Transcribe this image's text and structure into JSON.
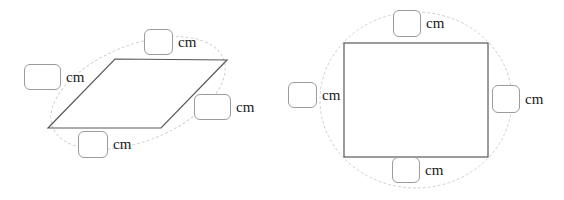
{
  "canvas": {
    "width": 564,
    "height": 200,
    "background": "#ffffff"
  },
  "style": {
    "shape_stroke": "#595959",
    "guide_stroke": "#cfcfcf",
    "box_border": "#9b9b9b",
    "text_color": "#1a1a1a"
  },
  "figures": [
    {
      "id": "parallelogram",
      "name": "parallelogram",
      "shape": {
        "type": "parallelogram",
        "points": "115,59 227,60 161,128 48,128"
      },
      "guide": {
        "type": "ellipse",
        "cx": 138,
        "cy": 93,
        "rx": 92,
        "ry": 48,
        "rotation": -22
      },
      "fields": [
        {
          "id": "pg-left",
          "side": "left",
          "value": "",
          "placeholder": "",
          "unit": "cm"
        },
        {
          "id": "pg-top",
          "side": "top",
          "value": "",
          "placeholder": "",
          "unit": "cm"
        },
        {
          "id": "pg-right",
          "side": "right",
          "value": "",
          "placeholder": "",
          "unit": "cm"
        },
        {
          "id": "pg-bottom",
          "side": "bottom",
          "value": "",
          "placeholder": "",
          "unit": "cm"
        }
      ]
    },
    {
      "id": "rectangle",
      "name": "rectangle",
      "shape": {
        "type": "rectangle",
        "x": 62,
        "y": 43,
        "width": 144,
        "height": 114
      },
      "guide": {
        "type": "ellipse",
        "cx": 134,
        "cy": 100,
        "rx": 96,
        "ry": 88,
        "rotation": 0
      },
      "fields": [
        {
          "id": "rc-top",
          "side": "top",
          "value": "",
          "placeholder": "",
          "unit": "cm"
        },
        {
          "id": "rc-left",
          "side": "left",
          "value": "",
          "placeholder": "",
          "unit": "cm"
        },
        {
          "id": "rc-right",
          "side": "right",
          "value": "",
          "placeholder": "",
          "unit": "cm"
        },
        {
          "id": "rc-bottom",
          "side": "bottom",
          "value": "",
          "placeholder": "",
          "unit": "cm"
        }
      ]
    }
  ]
}
